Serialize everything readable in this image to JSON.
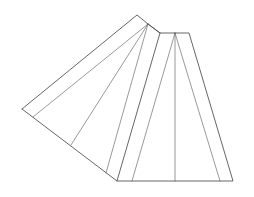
{
  "diagram": {
    "type": "geometric-line-drawing",
    "background": "#ffffff",
    "stroke_color": "#555555",
    "outline": [
      [
        22,
        109
      ],
      [
        137,
        15
      ],
      [
        148,
        24
      ],
      [
        160,
        33
      ],
      [
        175,
        33
      ],
      [
        189,
        33
      ],
      [
        233,
        181
      ],
      [
        117,
        181
      ],
      [
        22,
        109
      ]
    ],
    "lines": [
      {
        "x1": 148,
        "y1": 24,
        "x2": 33,
        "y2": 117,
        "w": 0.6
      },
      {
        "x1": 148,
        "y1": 24,
        "x2": 71,
        "y2": 145,
        "w": 0.6
      },
      {
        "x1": 148,
        "y1": 24,
        "x2": 106,
        "y2": 173,
        "w": 0.6
      },
      {
        "x1": 160,
        "y1": 33,
        "x2": 117,
        "y2": 181,
        "w": 0.9
      },
      {
        "x1": 175,
        "y1": 33,
        "x2": 132,
        "y2": 181,
        "w": 0.6
      },
      {
        "x1": 175,
        "y1": 33,
        "x2": 175,
        "y2": 181,
        "w": 0.6
      },
      {
        "x1": 175,
        "y1": 33,
        "x2": 220,
        "y2": 181,
        "w": 0.6
      },
      {
        "x1": 148,
        "y1": 24,
        "x2": 160,
        "y2": 33,
        "w": 0.9
      }
    ]
  }
}
